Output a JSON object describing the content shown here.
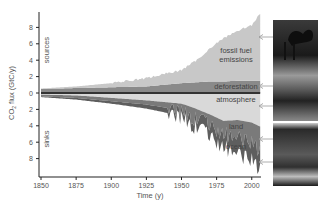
{
  "chart_data": {
    "type": "area",
    "title": "",
    "xlabel": "Time (y)",
    "ylabel": "CO2 flux (GtC/y)",
    "xlim": [
      1850,
      2006
    ],
    "ylim": [
      -10,
      10
    ],
    "grid": false,
    "xticks": [
      1850,
      1875,
      1900,
      1925,
      1950,
      1975,
      2000
    ],
    "yticks_sources": [
      0,
      2,
      4,
      6,
      8
    ],
    "yticks_sinks": [
      2,
      4,
      6,
      8
    ],
    "region_labels": {
      "sources": "sources",
      "sinks": "sinks"
    },
    "x": [
      1850,
      1875,
      1900,
      1925,
      1950,
      1960,
      1970,
      1980,
      1990,
      2000,
      2006
    ],
    "series": [
      {
        "name": "deforestation",
        "group": "sources",
        "color": "#8a8a8a",
        "values": [
          0.5,
          0.6,
          0.7,
          0.8,
          1.2,
          1.3,
          1.4,
          1.4,
          1.5,
          1.5,
          1.5
        ]
      },
      {
        "name": "fossil fuel emissions",
        "group": "sources",
        "color": "#c8c8c8",
        "values": [
          0.05,
          0.2,
          0.5,
          1.0,
          1.6,
          2.6,
          4.0,
          5.3,
          6.1,
          6.8,
          8.2
        ]
      },
      {
        "name": "atmosphere",
        "group": "sinks",
        "color": "#d9d9d9",
        "values": [
          0.2,
          0.3,
          0.6,
          0.9,
          1.3,
          1.9,
          2.6,
          3.4,
          3.3,
          3.6,
          4.1
        ]
      },
      {
        "name": "land",
        "group": "sinks",
        "color": "#7a7a7a",
        "values": [
          0.2,
          0.3,
          0.4,
          0.5,
          0.8,
          1.2,
          1.4,
          1.6,
          2.2,
          2.6,
          2.8
        ]
      },
      {
        "name": "ocean",
        "group": "sinks",
        "color": "#5e5e5e",
        "values": [
          0.1,
          0.2,
          0.3,
          0.5,
          0.7,
          1.0,
          1.3,
          1.6,
          1.9,
          2.1,
          2.3
        ]
      }
    ],
    "annotations": [
      {
        "label": "fossil fuel",
        "label2": "emissions",
        "series": "fossil fuel emissions"
      },
      {
        "label": "deforestation",
        "series": "deforestation"
      },
      {
        "label": "atmosphere",
        "series": "atmosphere"
      },
      {
        "label": "land",
        "series": "land"
      },
      {
        "label": "ocean",
        "series": "ocean"
      }
    ],
    "photos": [
      "fossil fuel emissions photo",
      "deforestation photo",
      "atmosphere photo",
      "land photo",
      "ocean photo"
    ]
  }
}
